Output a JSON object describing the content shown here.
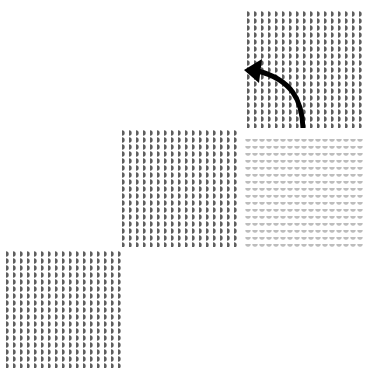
{
  "figure": {
    "colors": {
      "background": "#ffffff",
      "dark_glyph": "#5e5e5e",
      "light_glyph": "#bdbdbd",
      "arrow": "#000000"
    },
    "tiles": [
      {
        "id": "bottom-left",
        "glyph": "half-disc",
        "orientation": "right",
        "shade": "dark",
        "rows": 17,
        "cols": 17
      },
      {
        "id": "middle",
        "glyph": "half-disc",
        "orientation": "right",
        "shade": "dark",
        "rows": 17,
        "cols": 17
      },
      {
        "id": "top-right",
        "glyph": "half-disc",
        "orientation": "right",
        "shade": "dark",
        "rows": 17,
        "cols": 17
      },
      {
        "id": "light",
        "glyph": "half-disc",
        "orientation": "down",
        "shade": "light",
        "rows": 16,
        "cols": 17
      }
    ],
    "arrow": {
      "direction": "curved up-left",
      "from": "light-tile",
      "to": "top-right-tile"
    }
  }
}
